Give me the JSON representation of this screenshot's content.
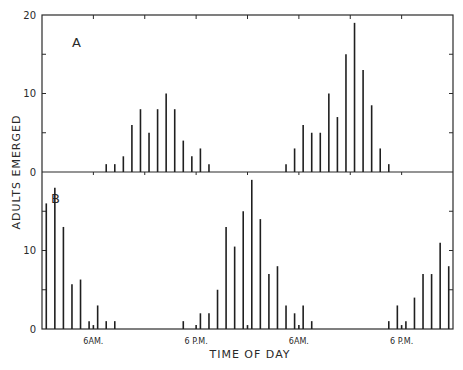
{
  "chart_data": {
    "type": "bar",
    "title": "",
    "xlabel": "TIME OF DAY",
    "ylabel": "ADULTS EMERGED",
    "x_unit": "hours from midnight (48-hour span)",
    "x_range": [
      0,
      48
    ],
    "x_tick_labels": [
      {
        "hour": 6,
        "label": "6AM."
      },
      {
        "hour": 18,
        "label": "6 P.M."
      },
      {
        "hour": 30,
        "label": "6AM."
      },
      {
        "hour": 42,
        "label": "6 P.M."
      }
    ],
    "x_minor_ticks_hours": [
      6,
      12,
      18,
      24,
      30,
      36,
      42
    ],
    "grid": false,
    "legend": null,
    "panels": [
      {
        "label": "A",
        "ylim": [
          0,
          20
        ],
        "y_tick_labels": [
          "0",
          "10",
          "20"
        ],
        "y_ticks": [
          0,
          5,
          10,
          15,
          20
        ],
        "series": [
          {
            "name": "Panel A emergence",
            "x": [
              7.5,
              8.5,
              9.5,
              10.5,
              11.5,
              12.5,
              13.5,
              14.5,
              15.5,
              16.5,
              17.5,
              18.5,
              19.5,
              28.5,
              29.5,
              30.5,
              31.5,
              32.5,
              33.5,
              34.5,
              35.5,
              36.5,
              37.5,
              38.5,
              39.5,
              40.5
            ],
            "values": [
              1,
              1,
              2,
              6,
              8,
              5,
              8,
              10,
              8,
              4,
              2,
              3,
              1,
              1,
              3,
              6,
              5,
              5,
              10,
              7,
              15,
              19,
              13,
              8.5,
              3,
              1
            ]
          }
        ]
      },
      {
        "label": "B",
        "ylim": [
          0,
          20
        ],
        "y_tick_labels": [
          "0",
          "10"
        ],
        "y_ticks": [
          0,
          5,
          10,
          15
        ],
        "series": [
          {
            "name": "Panel B emergence",
            "x": [
              0.5,
              1.5,
              2.5,
              3.5,
              4.5,
              5.5,
              6.0,
              6.5,
              7.5,
              8.5,
              16.5,
              18.0,
              18.5,
              19.5,
              20.5,
              21.5,
              22.5,
              23.5,
              24.0,
              24.5,
              25.5,
              26.5,
              27.5,
              28.5,
              29.5,
              30.0,
              30.5,
              31.5,
              40.5,
              41.5,
              42.0,
              42.5,
              43.5,
              44.5,
              45.5,
              46.5,
              47.5
            ],
            "values": [
              16,
              18,
              13,
              5.7,
              6.3,
              1,
              0.5,
              3,
              1,
              1,
              1,
              0.5,
              2,
              2,
              5,
              13,
              10.5,
              15,
              0.5,
              19,
              14,
              7,
              8,
              3,
              2,
              0.5,
              3,
              1,
              1,
              3,
              0.5,
              1,
              4,
              7,
              7,
              11,
              8
            ]
          }
        ]
      }
    ]
  }
}
